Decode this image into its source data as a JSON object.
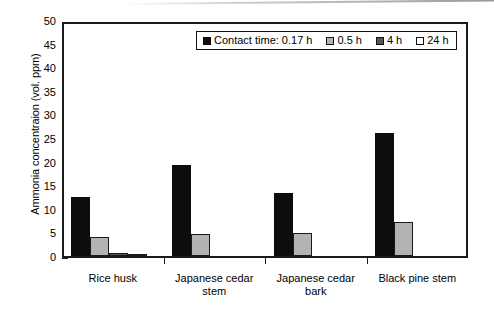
{
  "chart_data": {
    "type": "bar",
    "title": "",
    "xlabel": "",
    "ylabel": "Ammonia concentraion (vol. ppm)",
    "ylim": [
      0,
      50
    ],
    "ytick_values": [
      0,
      5,
      10,
      15,
      20,
      25,
      30,
      35,
      40,
      45,
      50
    ],
    "ytick_labels": [
      "0",
      "5",
      "10",
      "15",
      "20",
      "25",
      "30",
      "35",
      "40",
      "45",
      "50"
    ],
    "grid": false,
    "legend_position": "top-center",
    "legend_title": "Contact time:",
    "categories": [
      "Rice husk",
      "Japanese cedar stem",
      "Japanese cedar bark",
      "Black pine stem"
    ],
    "category_lines": [
      [
        "Rice husk"
      ],
      [
        "Japanese cedar",
        "stem"
      ],
      [
        "Japanese cedar",
        "bark"
      ],
      [
        "Black pine stem"
      ]
    ],
    "series": [
      {
        "name": "Contact time: 0.17 h",
        "short_name": "0.17 h",
        "color": "#0d0d0d",
        "values": [
          12.6,
          19.3,
          13.4,
          26.0
        ]
      },
      {
        "name": "0.5 h",
        "short_name": "0.5 h",
        "color": "#b3b3b3",
        "values": [
          4.1,
          4.6,
          4.8,
          7.3
        ]
      },
      {
        "name": "4 h",
        "short_name": "4 h",
        "color": "#555555",
        "values": [
          0.6,
          0.0,
          0.0,
          0.0
        ]
      },
      {
        "name": "24 h",
        "short_name": "24 h",
        "color": "#ffffff",
        "values": [
          0.3,
          0.0,
          0.0,
          0.0
        ]
      }
    ]
  },
  "axis": {
    "y_title": "Ammonia concentraion (vol. ppm)",
    "y_ticks": [
      "50",
      "45",
      "40",
      "35",
      "30",
      "25",
      "20",
      "15",
      "10",
      "5",
      "0"
    ],
    "x_categories": [
      {
        "line1": "Rice husk",
        "line2": ""
      },
      {
        "line1": "Japanese cedar",
        "line2": "stem"
      },
      {
        "line1": "Japanese cedar",
        "line2": "bark"
      },
      {
        "line1": "Black pine stem",
        "line2": ""
      }
    ]
  },
  "legend": {
    "entries": [
      {
        "label": "Contact time: 0.17 h",
        "color": "#0d0d0d"
      },
      {
        "label": "0.5 h",
        "color": "#b3b3b3"
      },
      {
        "label": "4 h",
        "color": "#555555"
      },
      {
        "label": "24 h",
        "color": "#ffffff"
      }
    ]
  }
}
